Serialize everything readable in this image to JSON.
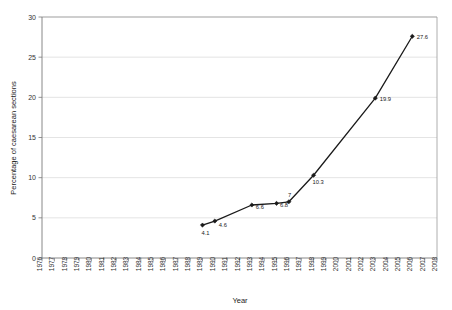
{
  "chart_data": {
    "type": "line",
    "title": "",
    "xlabel": "Year",
    "ylabel": "Percentage of caesarean sections",
    "xlim": [
      1976,
      2008
    ],
    "ylim": [
      0,
      30
    ],
    "grid": true,
    "legend": "none",
    "x_ticks": [
      1976,
      1977,
      1978,
      1979,
      1980,
      1981,
      1982,
      1983,
      1984,
      1985,
      1986,
      1987,
      1988,
      1989,
      1990,
      1991,
      1992,
      1993,
      1994,
      1995,
      1996,
      1997,
      1998,
      1999,
      2000,
      2001,
      2002,
      2003,
      2004,
      2005,
      2006,
      2007,
      2008
    ],
    "y_ticks": [
      0,
      5,
      10,
      15,
      20,
      25,
      30
    ],
    "series": [
      {
        "name": "Percentage of caesarean sections",
        "color": "#1a1a1a",
        "x": [
          1989,
          1990,
          1993,
          1995,
          1996,
          1998,
          2003,
          2006
        ],
        "values": [
          4.1,
          4.6,
          6.6,
          6.8,
          7,
          10.3,
          19.9,
          27.6
        ],
        "point_labels": [
          "4.1",
          "4.6",
          "6.6",
          "6.8",
          "7",
          "10.3",
          "19.9",
          "27.6"
        ]
      }
    ]
  }
}
